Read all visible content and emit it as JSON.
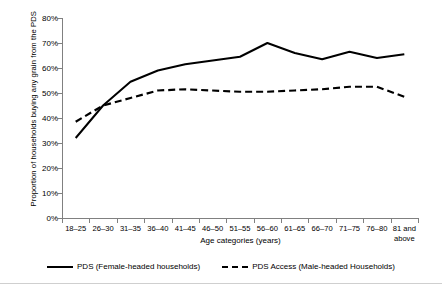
{
  "chart_data": {
    "type": "line",
    "title": "",
    "subtitle": "",
    "xlabel": "Age categories (years)",
    "ylabel": "Proportion of households buying any grain from the PDS",
    "categories": [
      "18–25",
      "26–30",
      "31–35",
      "36–40",
      "41–45",
      "46–50",
      "51–55",
      "56–60",
      "61–65",
      "66–70",
      "71–75",
      "76–80",
      "81 and above"
    ],
    "ylim": [
      0,
      80
    ],
    "yticks": [
      0,
      10,
      20,
      30,
      40,
      50,
      60,
      70,
      80
    ],
    "ytick_labels": [
      "0%",
      "10%",
      "20%",
      "30%",
      "40%",
      "50%",
      "60%",
      "70%",
      "80%"
    ],
    "grid": false,
    "legend_position": "bottom",
    "series": [
      {
        "name": "PDS (Female-headed households)",
        "style": "solid",
        "color": "#000000",
        "values": [
          32.0,
          45.0,
          54.5,
          59.0,
          61.5,
          63.0,
          64.5,
          70.0,
          66.0,
          63.5,
          66.5,
          64.0,
          65.5
        ]
      },
      {
        "name": "PDS Access (Male-headed Households)",
        "style": "dashed",
        "color": "#000000",
        "values": [
          38.5,
          45.0,
          48.0,
          51.0,
          51.5,
          51.0,
          50.5,
          50.5,
          51.0,
          51.5,
          52.5,
          52.5,
          48.5
        ]
      }
    ]
  },
  "axes": {
    "y_title": "Proportion of households buying any grain from the PDS",
    "x_title": "Age categories (years)"
  },
  "legend": {
    "items": [
      {
        "label": "PDS (Female-headed households)",
        "style": "solid"
      },
      {
        "label": "PDS Access (Male-headed Households)",
        "style": "dashed"
      }
    ]
  }
}
